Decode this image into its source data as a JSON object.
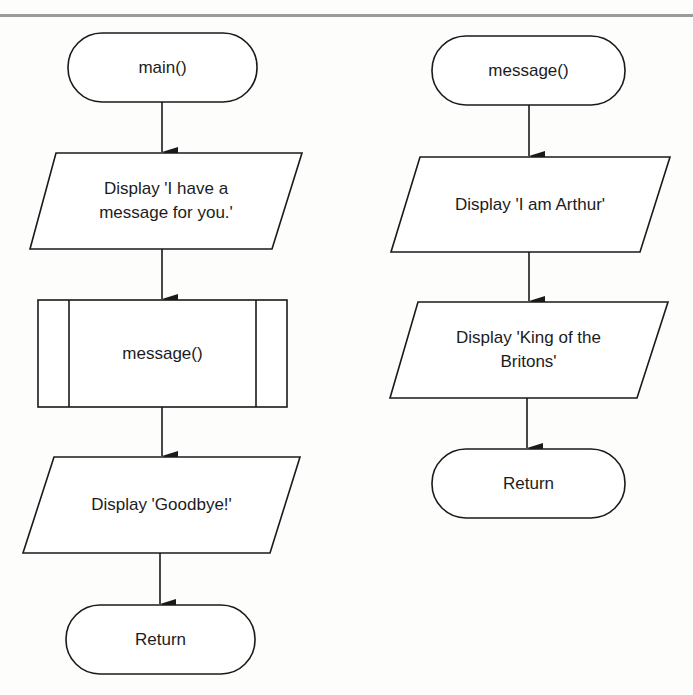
{
  "diagram": {
    "type": "flowchart",
    "colors": {
      "stroke": "#1a1a1a",
      "fill": "#ffffff",
      "header_rule": "#9a9a9a"
    },
    "flowcharts": [
      {
        "name": "main",
        "nodes": [
          {
            "id": "main-start",
            "shape": "terminal",
            "label": "main()"
          },
          {
            "id": "main-display-message",
            "shape": "input-output",
            "label": "Display 'I have a\nmessage for you.'"
          },
          {
            "id": "main-call-message",
            "shape": "predefined-process",
            "label": "message()"
          },
          {
            "id": "main-display-goodbye",
            "shape": "input-output",
            "label": "Display 'Goodbye!'"
          },
          {
            "id": "main-return",
            "shape": "terminal",
            "label": "Return"
          }
        ],
        "edges": [
          [
            "main-start",
            "main-display-message"
          ],
          [
            "main-display-message",
            "main-call-message"
          ],
          [
            "main-call-message",
            "main-display-goodbye"
          ],
          [
            "main-display-goodbye",
            "main-return"
          ]
        ]
      },
      {
        "name": "message",
        "nodes": [
          {
            "id": "message-start",
            "shape": "terminal",
            "label": "message()"
          },
          {
            "id": "message-display-arthur",
            "shape": "input-output",
            "label": "Display 'I am Arthur'"
          },
          {
            "id": "message-display-king",
            "shape": "input-output",
            "label": "Display 'King of the\nBritons'"
          },
          {
            "id": "message-return",
            "shape": "terminal",
            "label": "Return"
          }
        ],
        "edges": [
          [
            "message-start",
            "message-display-arthur"
          ],
          [
            "message-display-arthur",
            "message-display-king"
          ],
          [
            "message-display-king",
            "message-return"
          ]
        ]
      }
    ]
  }
}
